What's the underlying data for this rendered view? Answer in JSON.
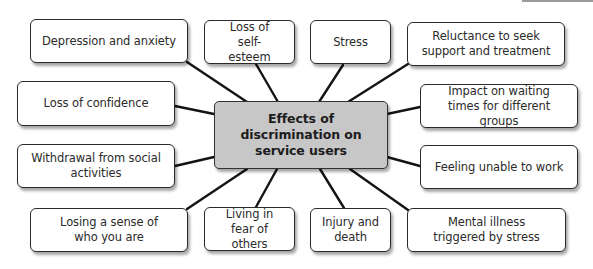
{
  "diagram": {
    "center": {
      "label": "Effects of discrimination on service users",
      "fill": "#c7c7c7"
    },
    "nodes": [
      {
        "id": "depression",
        "label": "Depression and anxiety"
      },
      {
        "id": "self-esteem",
        "label": "Loss of self-esteem"
      },
      {
        "id": "stress",
        "label": "Stress"
      },
      {
        "id": "reluctance",
        "label": "Reluctance to seek support and treatment"
      },
      {
        "id": "confidence",
        "label": "Loss of confidence"
      },
      {
        "id": "waiting-times",
        "label": "Impact on waiting times for different groups"
      },
      {
        "id": "withdrawal",
        "label": "Withdrawal from social activities"
      },
      {
        "id": "unable-to-work",
        "label": "Feeling unable to work"
      },
      {
        "id": "sense-of-self",
        "label": "Losing a sense of who you are"
      },
      {
        "id": "fear",
        "label": "Living in fear of others"
      },
      {
        "id": "injury",
        "label": "Injury and death"
      },
      {
        "id": "mental-illness",
        "label": "Mental illness triggered by stress"
      }
    ],
    "colors": {
      "line": "#141414",
      "node_border": "#2a2a2a",
      "node_fill": "#ffffff"
    }
  }
}
